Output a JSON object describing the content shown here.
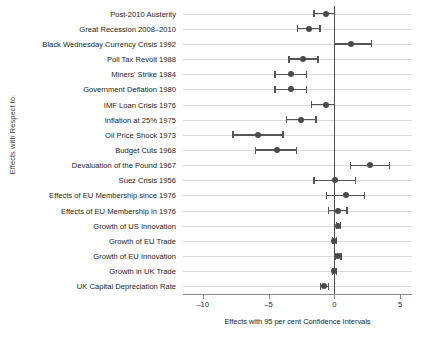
{
  "chart_data": {
    "type": "scatter",
    "title": "",
    "xlabel": "Effects with 95 per cent Confidence Intervals",
    "ylabel": "Effects with Respect to:",
    "xlim": [
      -11.5,
      5.9
    ],
    "xticks": [
      -10,
      -5,
      0,
      5
    ],
    "xticklabels": [
      "–10",
      "–5",
      "0",
      "5"
    ],
    "grid": true,
    "legend": "none",
    "zero_reference_line": 0,
    "categories": [
      "Post-2010 Austerity",
      "Great Recession 2008–2010",
      "Black Wednesday Currency Crisis 1992",
      "Poll Tax Revolt 1988",
      "Miners' Strike 1984",
      "Government Deflation 1980",
      "IMF Loan Crisis 1976",
      "Inflation at 25% 1975",
      "Oil Price Shock 1973",
      "Budget Cuts 1968",
      "Devaluation of the Pound 1967",
      "Suez Crisis 1956",
      "Effects of EU Membership since 1976",
      "Effects of EU Membership in 1976",
      "Growth of US Innovation",
      "Growth of EU Trade",
      "Growth of EU Innovation",
      "Growth in UK Trade",
      "UK Capital Depreciation Rate"
    ],
    "values": [
      -0.65,
      -1.95,
      1.3,
      -2.35,
      -3.3,
      -3.3,
      -0.6,
      -2.55,
      -5.8,
      -4.35,
      2.7,
      0.05,
      0.9,
      0.25,
      0.3,
      0.0,
      0.25,
      0.0,
      -0.75
    ],
    "ci_lower": [
      -1.55,
      -2.8,
      0.0,
      -3.45,
      -4.5,
      -4.5,
      -1.75,
      -3.65,
      -7.7,
      -6.0,
      1.25,
      -1.55,
      -0.6,
      -0.45,
      0.15,
      -0.15,
      0.05,
      -0.15,
      -1.05
    ],
    "ci_upper": [
      0.0,
      -1.1,
      2.8,
      -1.25,
      -2.1,
      -2.1,
      0.0,
      -1.4,
      -3.9,
      -2.9,
      4.2,
      1.6,
      2.3,
      0.95,
      0.45,
      0.15,
      0.5,
      0.15,
      -0.45
    ],
    "point_color": "#4a4a4a",
    "ci_color": "#555555",
    "grid_color": "#d9d9d9",
    "zero_line_color": "#4d4d4d"
  }
}
